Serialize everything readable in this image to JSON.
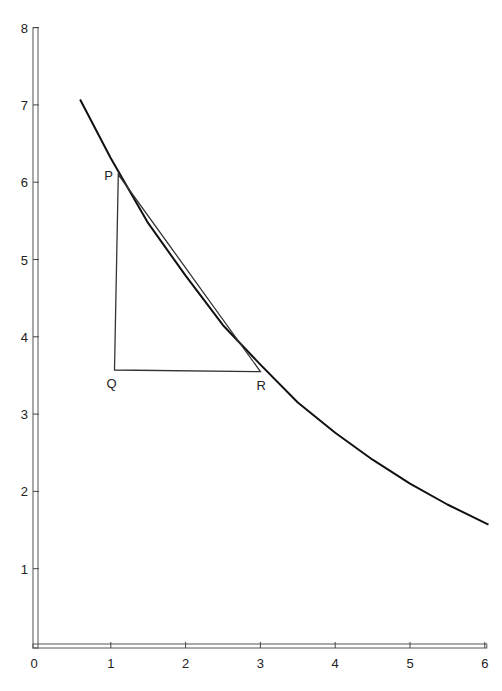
{
  "chart_data": {
    "type": "line",
    "title": "",
    "xlabel": "",
    "ylabel": "",
    "xlim": [
      0,
      6
    ],
    "ylim": [
      0,
      8
    ],
    "x_ticks": [
      "0",
      "1",
      "2",
      "3",
      "4",
      "5",
      "6"
    ],
    "y_ticks": [
      "1",
      "2",
      "3",
      "4",
      "5",
      "6",
      "7",
      "8"
    ],
    "grid": false,
    "series": [
      {
        "name": "curve",
        "x": [
          0.59,
          1.0,
          1.5,
          2.0,
          2.5,
          3.0,
          3.5,
          4.0,
          4.5,
          5.0,
          5.5,
          6.05
        ],
        "y": [
          7.07,
          6.31,
          5.47,
          4.79,
          4.15,
          3.64,
          3.15,
          2.76,
          2.41,
          2.1,
          1.83,
          1.57
        ]
      }
    ],
    "triangle": {
      "vertices": [
        {
          "label": "P",
          "x": 1.1,
          "y": 6.1
        },
        {
          "label": "Q",
          "x": 1.05,
          "y": 3.57
        },
        {
          "label": "R",
          "x": 3.0,
          "y": 3.55
        }
      ]
    }
  }
}
